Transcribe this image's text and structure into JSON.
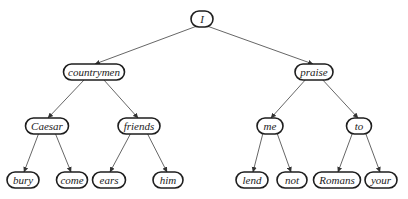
{
  "diagram": {
    "type": "tree",
    "nodes": [
      {
        "id": "I",
        "label": "I",
        "cx": 202,
        "cy": 19,
        "w": 22
      },
      {
        "id": "countrymen",
        "label": "countrymen",
        "cx": 94,
        "cy": 72,
        "w": 61
      },
      {
        "id": "praise",
        "label": "praise",
        "cx": 314,
        "cy": 72,
        "w": 38
      },
      {
        "id": "Caesar",
        "label": "Caesar",
        "cx": 47,
        "cy": 126,
        "w": 43
      },
      {
        "id": "friends",
        "label": "friends",
        "cx": 139,
        "cy": 126,
        "w": 42
      },
      {
        "id": "me",
        "label": "me",
        "cx": 270,
        "cy": 126,
        "w": 26
      },
      {
        "id": "to",
        "label": "to",
        "cx": 359,
        "cy": 126,
        "w": 25
      },
      {
        "id": "bury",
        "label": "bury",
        "cx": 23,
        "cy": 180,
        "w": 32
      },
      {
        "id": "come",
        "label": "come",
        "cx": 72,
        "cy": 180,
        "w": 31
      },
      {
        "id": "ears",
        "label": "ears",
        "cx": 109,
        "cy": 180,
        "w": 33
      },
      {
        "id": "him",
        "label": "him",
        "cx": 168,
        "cy": 180,
        "w": 30
      },
      {
        "id": "lend",
        "label": "lend",
        "cx": 252,
        "cy": 180,
        "w": 32
      },
      {
        "id": "not",
        "label": "not",
        "cx": 292,
        "cy": 180,
        "w": 30
      },
      {
        "id": "Romans",
        "label": "Romans",
        "cx": 337,
        "cy": 180,
        "w": 47
      },
      {
        "id": "your",
        "label": "your",
        "cx": 381,
        "cy": 180,
        "w": 32
      }
    ],
    "edges": [
      {
        "from": "I",
        "to": "countrymen"
      },
      {
        "from": "I",
        "to": "praise"
      },
      {
        "from": "countrymen",
        "to": "Caesar"
      },
      {
        "from": "countrymen",
        "to": "friends"
      },
      {
        "from": "praise",
        "to": "me"
      },
      {
        "from": "praise",
        "to": "to"
      },
      {
        "from": "Caesar",
        "to": "bury"
      },
      {
        "from": "Caesar",
        "to": "come"
      },
      {
        "from": "friends",
        "to": "ears"
      },
      {
        "from": "friends",
        "to": "him"
      },
      {
        "from": "me",
        "to": "lend"
      },
      {
        "from": "me",
        "to": "not"
      },
      {
        "from": "to",
        "to": "Romans"
      },
      {
        "from": "to",
        "to": "your"
      }
    ],
    "node_height": 16,
    "colors": {
      "node_border": "#1e1e1e",
      "edge": "#555555",
      "text": "#222222",
      "background": "#ffffff"
    }
  }
}
